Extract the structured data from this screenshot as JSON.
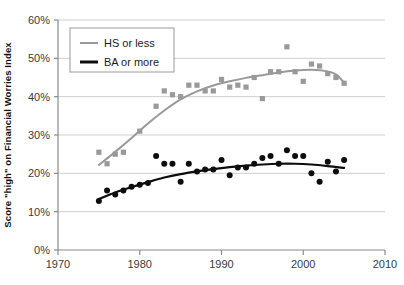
{
  "chart_data": {
    "type": "scatter",
    "title": "",
    "subtitle": "",
    "xlabel": "",
    "ylabel": "Score \"high\" on Financial Worries Index",
    "xlim": [
      1970,
      2010
    ],
    "ylim": [
      0,
      60
    ],
    "x_ticks": [
      1970,
      1980,
      1990,
      2000,
      2010
    ],
    "x_tick_labels": [
      "1970",
      "1980",
      "1990",
      "2000",
      "2010"
    ],
    "y_ticks": [
      0,
      10,
      20,
      30,
      40,
      50,
      60
    ],
    "y_tick_labels": [
      "0%",
      "10%",
      "20%",
      "30%",
      "40%",
      "50%",
      "60%"
    ],
    "grid": "horizontal",
    "legend_position": "top-left",
    "series": [
      {
        "name": "HS or less",
        "color": "#999999",
        "marker": "square",
        "points": [
          {
            "x": 1975,
            "y": 25.5
          },
          {
            "x": 1976,
            "y": 22.5
          },
          {
            "x": 1977,
            "y": 25.0
          },
          {
            "x": 1978,
            "y": 25.5
          },
          {
            "x": 1980,
            "y": 31.0
          },
          {
            "x": 1982,
            "y": 37.5
          },
          {
            "x": 1983,
            "y": 41.5
          },
          {
            "x": 1984,
            "y": 40.5
          },
          {
            "x": 1985,
            "y": 40.0
          },
          {
            "x": 1986,
            "y": 43.0
          },
          {
            "x": 1987,
            "y": 43.0
          },
          {
            "x": 1988,
            "y": 41.5
          },
          {
            "x": 1989,
            "y": 41.5
          },
          {
            "x": 1990,
            "y": 44.5
          },
          {
            "x": 1991,
            "y": 42.5
          },
          {
            "x": 1992,
            "y": 43.0
          },
          {
            "x": 1993,
            "y": 42.5
          },
          {
            "x": 1994,
            "y": 45.0
          },
          {
            "x": 1995,
            "y": 39.5
          },
          {
            "x": 1996,
            "y": 46.5
          },
          {
            "x": 1997,
            "y": 46.5
          },
          {
            "x": 1998,
            "y": 53.0
          },
          {
            "x": 1999,
            "y": 46.5
          },
          {
            "x": 2000,
            "y": 44.0
          },
          {
            "x": 2001,
            "y": 48.5
          },
          {
            "x": 2002,
            "y": 48.0
          },
          {
            "x": 2003,
            "y": 46.0
          },
          {
            "x": 2004,
            "y": 45.0
          },
          {
            "x": 2005,
            "y": 43.5
          }
        ],
        "trend": [
          {
            "x": 1975,
            "y": 22.2
          },
          {
            "x": 1977,
            "y": 25.6
          },
          {
            "x": 1979,
            "y": 29.2
          },
          {
            "x": 1981,
            "y": 33.0
          },
          {
            "x": 1983,
            "y": 36.4
          },
          {
            "x": 1985,
            "y": 39.3
          },
          {
            "x": 1987,
            "y": 41.4
          },
          {
            "x": 1989,
            "y": 42.9
          },
          {
            "x": 1991,
            "y": 44.0
          },
          {
            "x": 1993,
            "y": 44.9
          },
          {
            "x": 1995,
            "y": 45.6
          },
          {
            "x": 1997,
            "y": 46.3
          },
          {
            "x": 1999,
            "y": 46.8
          },
          {
            "x": 2001,
            "y": 47.0
          },
          {
            "x": 2003,
            "y": 46.6
          },
          {
            "x": 2004,
            "y": 45.8
          },
          {
            "x": 2005,
            "y": 43.7
          }
        ]
      },
      {
        "name": "BA or more",
        "color": "#0d0d0d",
        "marker": "circle",
        "points": [
          {
            "x": 1975,
            "y": 12.8
          },
          {
            "x": 1976,
            "y": 15.5
          },
          {
            "x": 1977,
            "y": 14.5
          },
          {
            "x": 1978,
            "y": 15.5
          },
          {
            "x": 1979,
            "y": 16.5
          },
          {
            "x": 1980,
            "y": 17.0
          },
          {
            "x": 1981,
            "y": 17.5
          },
          {
            "x": 1982,
            "y": 24.5
          },
          {
            "x": 1983,
            "y": 22.5
          },
          {
            "x": 1984,
            "y": 22.5
          },
          {
            "x": 1985,
            "y": 17.8
          },
          {
            "x": 1986,
            "y": 22.5
          },
          {
            "x": 1987,
            "y": 20.5
          },
          {
            "x": 1988,
            "y": 21.0
          },
          {
            "x": 1989,
            "y": 21.0
          },
          {
            "x": 1990,
            "y": 23.5
          },
          {
            "x": 1991,
            "y": 19.5
          },
          {
            "x": 1992,
            "y": 21.5
          },
          {
            "x": 1993,
            "y": 21.5
          },
          {
            "x": 1994,
            "y": 22.5
          },
          {
            "x": 1995,
            "y": 24.0
          },
          {
            "x": 1996,
            "y": 24.5
          },
          {
            "x": 1997,
            "y": 22.5
          },
          {
            "x": 1998,
            "y": 26.0
          },
          {
            "x": 1999,
            "y": 24.5
          },
          {
            "x": 2000,
            "y": 24.5
          },
          {
            "x": 2001,
            "y": 20.0
          },
          {
            "x": 2002,
            "y": 17.8
          },
          {
            "x": 2003,
            "y": 23.0
          },
          {
            "x": 2004,
            "y": 20.5
          },
          {
            "x": 2005,
            "y": 23.5
          }
        ],
        "trend": [
          {
            "x": 1975,
            "y": 13.3
          },
          {
            "x": 1977,
            "y": 15.0
          },
          {
            "x": 1979,
            "y": 16.4
          },
          {
            "x": 1981,
            "y": 17.7
          },
          {
            "x": 1983,
            "y": 18.9
          },
          {
            "x": 1985,
            "y": 19.8
          },
          {
            "x": 1987,
            "y": 20.5
          },
          {
            "x": 1989,
            "y": 21.1
          },
          {
            "x": 1991,
            "y": 21.6
          },
          {
            "x": 1993,
            "y": 22.0
          },
          {
            "x": 1995,
            "y": 22.3
          },
          {
            "x": 1997,
            "y": 22.5
          },
          {
            "x": 1999,
            "y": 22.5
          },
          {
            "x": 2001,
            "y": 22.3
          },
          {
            "x": 2003,
            "y": 21.9
          },
          {
            "x": 2005,
            "y": 21.4
          }
        ]
      }
    ]
  },
  "legend": {
    "items": [
      {
        "label": "HS or less",
        "color": "#999999",
        "thickness": 2
      },
      {
        "label": "BA or more",
        "color": "#0d0d0d",
        "thickness": 3
      }
    ]
  },
  "axes": {
    "y_title": "Score \"high\" on Financial Worries Index"
  }
}
